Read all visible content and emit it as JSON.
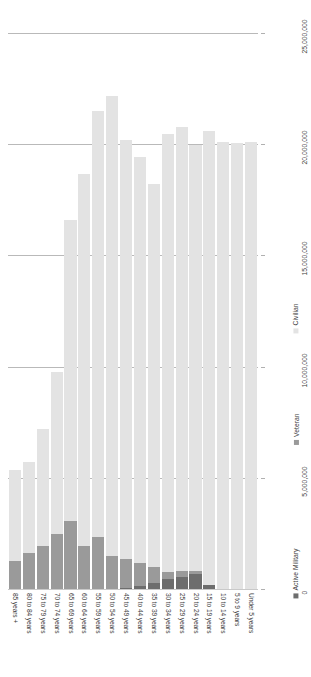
{
  "chart_data": {
    "type": "bar",
    "orientation": "vertical-bars-rotated-90",
    "stacked": true,
    "title": "",
    "xlabel": "",
    "ylabel": "",
    "grid": true,
    "legend_position": "bottom",
    "ylim": [
      0,
      25000000
    ],
    "yticks": [
      0,
      5000000,
      10000000,
      15000000,
      20000000,
      25000000
    ],
    "ytick_labels": [
      "0",
      "5,000,000",
      "10,000,000",
      "15,000,000",
      "20,000,000",
      "25,000,000"
    ],
    "categories": [
      "85 years +",
      "80 to 84 years",
      "75 to 79 years",
      "70 to 74 years",
      "65 to 69 years",
      "60 to 64 years",
      "55 to 59 years",
      "50 to 54 years",
      "45 to 49 years",
      "40 to 44 years",
      "35 to 39 years",
      "30 to 34 years",
      "25 to 29 years",
      "20 to 24 years",
      "15 to 19 years",
      "10 to 14 years",
      "5 to 9 years",
      "Under 5 years"
    ],
    "series": [
      {
        "name": "Active Military",
        "color": "#6d6d6d",
        "values": [
          0,
          0,
          0,
          0,
          0,
          0,
          0,
          0,
          60000,
          150000,
          250000,
          430000,
          560000,
          680000,
          190000,
          0,
          0,
          0
        ]
      },
      {
        "name": "Veteran",
        "color": "#9a9a9a",
        "values": [
          1250000,
          1620000,
          1950000,
          2480000,
          3050000,
          1950000,
          2330000,
          1480000,
          1270000,
          1000000,
          760000,
          330000,
          240000,
          120000,
          0,
          0,
          0,
          0
        ]
      },
      {
        "name": "Civilian",
        "color": "#e3e3e3",
        "values": [
          4080000,
          4100000,
          5260000,
          7270000,
          13550000,
          16730000,
          19180000,
          20700000,
          18880000,
          18270000,
          17180000,
          19690000,
          19960000,
          19180000,
          20420000,
          20120000,
          20050000,
          20100000
        ]
      }
    ],
    "totals": [
      5330000,
      5720000,
      7210000,
      9750000,
      16600000,
      18680000,
      21510000,
      22180000,
      20210000,
      19420000,
      18190000,
      20450000,
      20760000,
      19980000,
      20610000,
      20120000,
      20050000,
      20100000
    ]
  },
  "legend": {
    "items": [
      {
        "label": "Active Military",
        "color": "#6d6d6d"
      },
      {
        "label": "Veteran",
        "color": "#9a9a9a"
      },
      {
        "label": "Civilian",
        "color": "#e3e3e3"
      }
    ]
  },
  "colors": {
    "gridline": "#b9b9b9",
    "text": "#3c3c3c",
    "background": "#ffffff"
  }
}
